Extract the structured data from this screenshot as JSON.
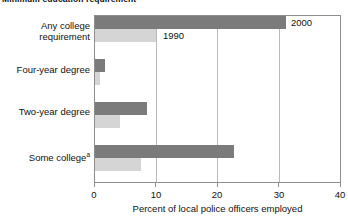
{
  "chart_data": {
    "type": "bar",
    "orientation": "horizontal",
    "title": "Minimum education requirement",
    "xlabel": "Percent of local police officers employed",
    "ylabel": "",
    "xlim": [
      0,
      40
    ],
    "xticks": [
      0,
      10,
      20,
      30,
      40
    ],
    "xtick_labels": [
      "0",
      "10",
      "20",
      "30",
      "40"
    ],
    "grid": true,
    "grid_axis": "x",
    "legend_position": "inline-annotation",
    "categories": [
      "Any college requirement",
      "Four-year degree",
      "Two-year degree",
      "Some college"
    ],
    "category_footnotes": [
      "",
      "",
      "",
      "a"
    ],
    "series": [
      {
        "name": "2000",
        "color": "#7b7b7b",
        "values": [
          31.0,
          1.6,
          8.5,
          22.5
        ]
      },
      {
        "name": "1990",
        "color": "#d5d5d5",
        "values": [
          10.0,
          0.8,
          4.0,
          7.5
        ]
      }
    ],
    "annotations": [
      {
        "text": "2000",
        "series": "2000",
        "category": "Any college requirement"
      },
      {
        "text": "1990",
        "series": "1990",
        "category": "Any college requirement"
      }
    ]
  },
  "colors": {
    "series_recent": "#7b7b7b",
    "series_older": "#d5d5d5",
    "frame": "#8e8e8e",
    "gridline": "#b9b9b9",
    "text": "#111111",
    "background": "#ffffff"
  }
}
